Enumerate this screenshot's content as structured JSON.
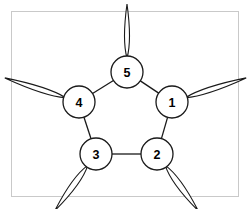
{
  "figure": {
    "title": "",
    "background_color": "#ffffff",
    "frame": {
      "name": "image-frame",
      "stroke_color": "#c9c9c9",
      "x": 11,
      "y": 11,
      "width": 228,
      "height": 186
    }
  },
  "diagram": {
    "type": "pentagon-node-graph",
    "stroke_color": "#1a1a1a",
    "node_fill": "#ffffff",
    "node_radius": 16,
    "nodes": [
      {
        "id": "node-1",
        "label": "1",
        "cx": 172,
        "cy": 102,
        "petal_angle_deg": 342
      },
      {
        "id": "node-2",
        "label": "2",
        "cx": 157,
        "cy": 154,
        "petal_angle_deg": 54
      },
      {
        "id": "node-3",
        "label": "3",
        "cx": 96,
        "cy": 154,
        "petal_angle_deg": 126
      },
      {
        "id": "node-4",
        "label": "4",
        "cx": 79,
        "cy": 102,
        "petal_angle_deg": 198
      },
      {
        "id": "node-5",
        "label": "5",
        "cx": 127,
        "cy": 72,
        "petal_angle_deg": 270
      }
    ],
    "edges": [
      {
        "name": "edge-5-1",
        "from": "node-5",
        "to": "node-1"
      },
      {
        "name": "edge-1-2",
        "from": "node-1",
        "to": "node-2"
      },
      {
        "name": "edge-2-3",
        "from": "node-2",
        "to": "node-3"
      },
      {
        "name": "edge-3-4",
        "from": "node-3",
        "to": "node-4"
      },
      {
        "name": "edge-4-5",
        "from": "node-4",
        "to": "node-5"
      }
    ],
    "petals": [
      {
        "name": "petal-node-1",
        "node": "node-1",
        "length": 62,
        "half_width": 5
      },
      {
        "name": "petal-node-2",
        "node": "node-2",
        "length": 54,
        "half_width": 6
      },
      {
        "name": "petal-node-3",
        "node": "node-3",
        "length": 54,
        "half_width": 6
      },
      {
        "name": "petal-node-4",
        "node": "node-4",
        "length": 62,
        "half_width": 5
      },
      {
        "name": "petal-node-5",
        "node": "node-5",
        "length": 52,
        "half_width": 5
      }
    ]
  }
}
